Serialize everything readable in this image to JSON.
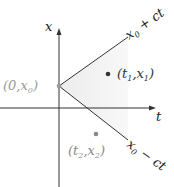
{
  "diagram": {
    "axes": {
      "horizontal_label": "t",
      "vertical_label": "x"
    },
    "lines": [
      {
        "id": "upper",
        "label_main": "x",
        "label_sub": "0",
        "label_rest": " + ct"
      },
      {
        "id": "lower",
        "label_main": "x",
        "label_sub": "0",
        "label_rest": " − ct"
      }
    ],
    "points": [
      {
        "id": "origin",
        "label_open": "(0,",
        "label_var": "x",
        "label_sub": "0",
        "label_close": ")",
        "color": "#999999"
      },
      {
        "id": "p1",
        "label_open": "(t",
        "label_sub1": "1",
        "label_mid": ",x",
        "label_sub2": "1",
        "label_close": ")",
        "color": "#333333"
      },
      {
        "id": "p2",
        "label_open": "(t",
        "label_sub1": "2",
        "label_mid": ",x",
        "label_sub2": "2",
        "label_close": ")",
        "color": "#888888"
      }
    ],
    "colors": {
      "axis": "#333333",
      "cone_fill": "#f1f1f1",
      "line": "#333333",
      "origin_label": "#999999",
      "p1_label": "#333333",
      "p2_label": "#888888"
    }
  }
}
